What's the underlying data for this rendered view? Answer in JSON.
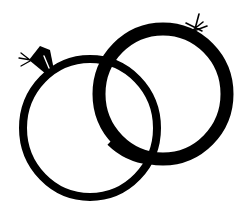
{
  "illustration": {
    "title": "Interlocking wedding rings",
    "background_color": "#ffffff",
    "ink_color": "#000000",
    "rings": [
      {
        "name": "diamond-ring",
        "cx": 90,
        "cy": 128,
        "rx": 67,
        "ry": 69,
        "stroke_width": 8,
        "has_gem": true
      },
      {
        "name": "band-ring",
        "cx": 163,
        "cy": 94,
        "rx": 64,
        "ry": 65,
        "stroke_width": 13,
        "has_sparkle": true
      }
    ],
    "gem": {
      "description": "diamond"
    },
    "sparkle": {
      "description": "sparkle on band"
    }
  }
}
